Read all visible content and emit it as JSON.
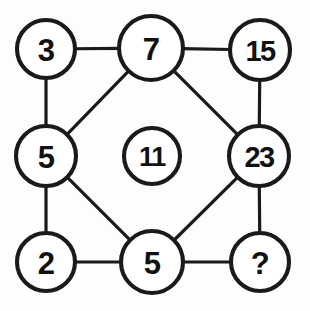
{
  "figure": {
    "background_color": "#fdfdfd",
    "stroke_color": "#1a1a1a",
    "node_fill": "#ffffff",
    "width": 310,
    "height": 311
  },
  "nodes": [
    {
      "id": "top-left",
      "label": "3",
      "cx": 46,
      "cy": 49,
      "r": 29,
      "position": "top-left corner"
    },
    {
      "id": "top-center",
      "label": "7",
      "cx": 151,
      "cy": 48,
      "r": 32,
      "position": "top middle"
    },
    {
      "id": "top-right",
      "label": "15",
      "cx": 260,
      "cy": 50,
      "r": 30,
      "position": "top-right corner"
    },
    {
      "id": "middle-left",
      "label": "5",
      "cx": 46,
      "cy": 156,
      "r": 30,
      "position": "left middle"
    },
    {
      "id": "center",
      "label": "11",
      "cx": 152,
      "cy": 156,
      "r": 28,
      "position": "center"
    },
    {
      "id": "middle-right",
      "label": "23",
      "cx": 259,
      "cy": 156,
      "r": 30,
      "position": "right middle"
    },
    {
      "id": "bottom-left",
      "label": "2",
      "cx": 46,
      "cy": 262,
      "r": 29,
      "position": "bottom-left corner"
    },
    {
      "id": "bottom-center",
      "label": "5",
      "cx": 152,
      "cy": 262,
      "r": 31,
      "position": "bottom middle"
    },
    {
      "id": "bottom-right",
      "label": "?",
      "cx": 260,
      "cy": 262,
      "r": 29,
      "position": "bottom-right corner"
    }
  ],
  "edges": [
    {
      "id": "edge-3-7",
      "from": "top-left",
      "to": "top-center",
      "kind": "horizontal"
    },
    {
      "id": "edge-7-15",
      "from": "top-center",
      "to": "top-right",
      "kind": "horizontal"
    },
    {
      "id": "edge-3-5",
      "from": "top-left",
      "to": "middle-left",
      "kind": "vertical"
    },
    {
      "id": "edge-15-23",
      "from": "top-right",
      "to": "middle-right",
      "kind": "vertical"
    },
    {
      "id": "edge-5-2",
      "from": "middle-left",
      "to": "bottom-left",
      "kind": "vertical"
    },
    {
      "id": "edge-23-q",
      "from": "middle-right",
      "to": "bottom-right",
      "kind": "vertical"
    },
    {
      "id": "edge-2-5b",
      "from": "bottom-left",
      "to": "bottom-center",
      "kind": "horizontal"
    },
    {
      "id": "edge-5b-q",
      "from": "bottom-center",
      "to": "bottom-right",
      "kind": "horizontal"
    },
    {
      "id": "edge-7-5l",
      "from": "top-center",
      "to": "middle-left",
      "kind": "diagonal"
    },
    {
      "id": "edge-7-23",
      "from": "top-center",
      "to": "middle-right",
      "kind": "diagonal"
    },
    {
      "id": "edge-5l-5b",
      "from": "middle-left",
      "to": "bottom-center",
      "kind": "diagonal"
    },
    {
      "id": "edge-23-5b",
      "from": "middle-right",
      "to": "bottom-center",
      "kind": "diagonal"
    }
  ]
}
